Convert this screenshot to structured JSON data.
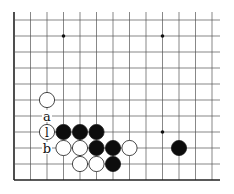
{
  "board": {
    "grid": {
      "x_lines": [
        14,
        30.5,
        47,
        63.5,
        80,
        96.5,
        113,
        129.5,
        146,
        162.5,
        179,
        195.5,
        212
      ],
      "y_lines": [
        20,
        36,
        52,
        68,
        84,
        100,
        116,
        132,
        148,
        164,
        180
      ],
      "left_edge": true,
      "bottom_edge": true,
      "line_color": "#555555",
      "edge_color": "#222222"
    },
    "star_points": [
      {
        "col": 3,
        "row": 1
      },
      {
        "col": 9,
        "row": 1
      },
      {
        "col": 9,
        "row": 7
      }
    ],
    "stones": [
      {
        "color": "white",
        "col": 2,
        "row": 5
      },
      {
        "color": "white",
        "col": 2,
        "row": 7,
        "label": "l"
      },
      {
        "color": "black",
        "col": 3,
        "row": 7
      },
      {
        "color": "black",
        "col": 4,
        "row": 7
      },
      {
        "color": "black",
        "col": 5,
        "row": 7
      },
      {
        "color": "white",
        "col": 3,
        "row": 8
      },
      {
        "color": "white",
        "col": 4,
        "row": 8
      },
      {
        "color": "black",
        "col": 5,
        "row": 8
      },
      {
        "color": "black",
        "col": 6,
        "row": 8
      },
      {
        "color": "white",
        "col": 7,
        "row": 8
      },
      {
        "color": "black",
        "col": 10,
        "row": 8
      },
      {
        "color": "white",
        "col": 4,
        "row": 9
      },
      {
        "color": "white",
        "col": 5,
        "row": 9
      },
      {
        "color": "black",
        "col": 6,
        "row": 9
      }
    ],
    "labels": [
      {
        "text": "a",
        "col": 2,
        "row": 6
      },
      {
        "text": "b",
        "col": 2,
        "row": 8
      }
    ]
  }
}
